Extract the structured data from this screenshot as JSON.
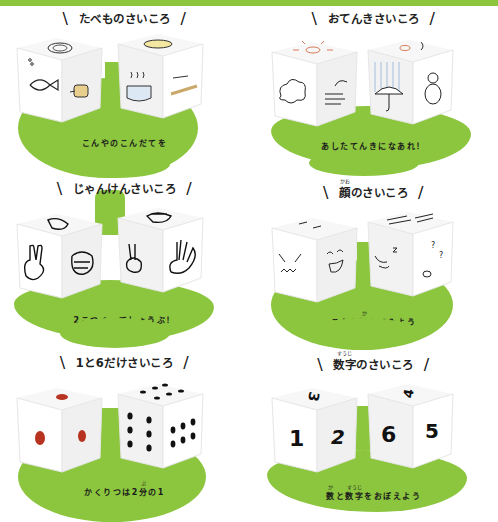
{
  "colors": {
    "accent_green": "#8cc63f",
    "ink": "#1a1a1a",
    "pip_red": "#b83220"
  },
  "panels": [
    {
      "title": "たべものさいころ",
      "caption_lines": [
        "こんやのこんだてを",
        "きめよう"
      ],
      "dice": [
        {
          "faces": [
            "bowl-icon",
            "fish-icon",
            "meat-icon"
          ]
        },
        {
          "faces": [
            "omelette-icon",
            "pot-icon",
            "noodles-icon"
          ]
        }
      ]
    },
    {
      "title": "おてんきさいころ",
      "caption_lines": [
        "あしたてんきになあれ！"
      ],
      "dice": [
        {
          "faces": [
            "sun-icon",
            "cloud-icon",
            "wind-icon"
          ]
        },
        {
          "faces": [
            "sun-wind-icon",
            "umbrella-rain-icon",
            "snowman-icon"
          ]
        }
      ]
    },
    {
      "title": "じゃんけんさいころ",
      "caption_lines": [
        "2こつくってしょうぶ！"
      ],
      "dice": [
        {
          "faces": [
            "scissors-hand-icon",
            "scissors-hand-icon",
            "rock-hand-icon"
          ]
        },
        {
          "faces": [
            "rock-hand-icon",
            "scissors-hand-icon",
            "paper-hand-icon"
          ]
        }
      ]
    },
    {
      "title_ruby": {
        "base": "顔",
        "reading": "かお"
      },
      "title_rest": "のさいころ",
      "caption_pre": "こんな",
      "caption_ruby": {
        "base": "顔",
        "reading": "かお"
      },
      "caption_post": "してみよう",
      "dice": [
        {
          "faces": [
            "sleepy-face-icon",
            "angry-face-icon",
            "laughing-face-icon"
          ]
        },
        {
          "faces": [
            "eyebrows-face-icon",
            "sleeping-face-icon",
            "confused-face-icon"
          ]
        }
      ]
    },
    {
      "title": "1と6だけさいころ",
      "caption_pre": "かくりつは2",
      "caption_ruby": {
        "base": "分",
        "reading": "ぶん"
      },
      "caption_post": "の1",
      "dice": [
        {
          "top": 1,
          "left": 1,
          "right": 1
        },
        {
          "top": 6,
          "left": 6,
          "right": 6
        }
      ]
    },
    {
      "title_ruby": {
        "base": "数字",
        "reading": "すうじ"
      },
      "title_rest": "のさいころ",
      "caption_ruby1": {
        "base": "数",
        "reading": "かず"
      },
      "caption_mid": "と",
      "caption_ruby2": {
        "base": "数字",
        "reading": "すうじ"
      },
      "caption_post": "をおぼえよう",
      "dice": [
        {
          "top": "3",
          "left": "1",
          "right": "2"
        },
        {
          "top": "4",
          "left": "6",
          "right": "5"
        }
      ]
    }
  ]
}
